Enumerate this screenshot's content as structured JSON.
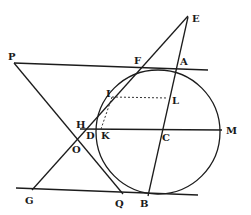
{
  "figure": {
    "type": "geometric-construction",
    "colors": {
      "ink": "#1c1c1c",
      "background": "#ffffff"
    },
    "circle": {
      "center": [
        158,
        132
      ],
      "radius": 62
    },
    "points": {
      "P": [
        14,
        62
      ],
      "E": [
        188,
        17
      ],
      "F": [
        165,
        66
      ],
      "A": [
        183,
        69
      ],
      "I": [
        112,
        97
      ],
      "L": [
        170,
        98
      ],
      "H": [
        82,
        128
      ],
      "D": [
        92,
        132
      ],
      "K": [
        100,
        130
      ],
      "C": [
        161,
        130
      ],
      "M": [
        220,
        130
      ],
      "O": [
        80,
        137
      ],
      "G": [
        32,
        190
      ],
      "Q": [
        122,
        193
      ],
      "B": [
        148,
        195
      ]
    },
    "labels": [
      {
        "id": "P",
        "text": "P",
        "x": 8,
        "y": 60
      },
      {
        "id": "E",
        "text": "E",
        "x": 192,
        "y": 22
      },
      {
        "id": "F",
        "text": "F",
        "x": 135,
        "y": 64
      },
      {
        "id": "A",
        "text": "A",
        "x": 181,
        "y": 65
      },
      {
        "id": "I",
        "text": "I",
        "x": 107,
        "y": 97
      },
      {
        "id": "L",
        "text": "L",
        "x": 172,
        "y": 104
      },
      {
        "id": "H",
        "text": "H",
        "x": 77,
        "y": 128
      },
      {
        "id": "D",
        "text": "D",
        "x": 86,
        "y": 139
      },
      {
        "id": "K",
        "text": "K",
        "x": 101,
        "y": 139
      },
      {
        "id": "C",
        "text": "C",
        "x": 163,
        "y": 141
      },
      {
        "id": "M",
        "text": "M",
        "x": 227,
        "y": 134
      },
      {
        "id": "O",
        "text": "O",
        "x": 72,
        "y": 153
      },
      {
        "id": "G",
        "text": "G",
        "x": 25,
        "y": 203
      },
      {
        "id": "Q",
        "text": "Q",
        "x": 116,
        "y": 207
      },
      {
        "id": "B",
        "text": "B",
        "x": 140,
        "y": 207
      }
    ]
  }
}
